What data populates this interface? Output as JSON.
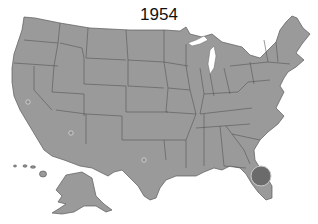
{
  "title": "1954",
  "map": {
    "type": "US states choropleth / bubble map",
    "land_color": "#9a9a9a",
    "border_color": "#555555",
    "background": "#ffffff",
    "markers": [
      {
        "name": "California",
        "cx": 28,
        "cy": 102,
        "r": 2.2,
        "fill": "#8e8e8e",
        "stroke": "#d8d8d8"
      },
      {
        "name": "Arizona",
        "cx": 71,
        "cy": 133,
        "r": 2.2,
        "fill": "#8e8e8e",
        "stroke": "#d8d8d8"
      },
      {
        "name": "Texas",
        "cx": 144,
        "cy": 160,
        "r": 2.2,
        "fill": "#8e8e8e",
        "stroke": "#d8d8d8"
      },
      {
        "name": "Florida",
        "cx": 261,
        "cy": 176,
        "r": 10,
        "fill": "#6b6b6b",
        "stroke": "#c8c8c8"
      }
    ]
  }
}
